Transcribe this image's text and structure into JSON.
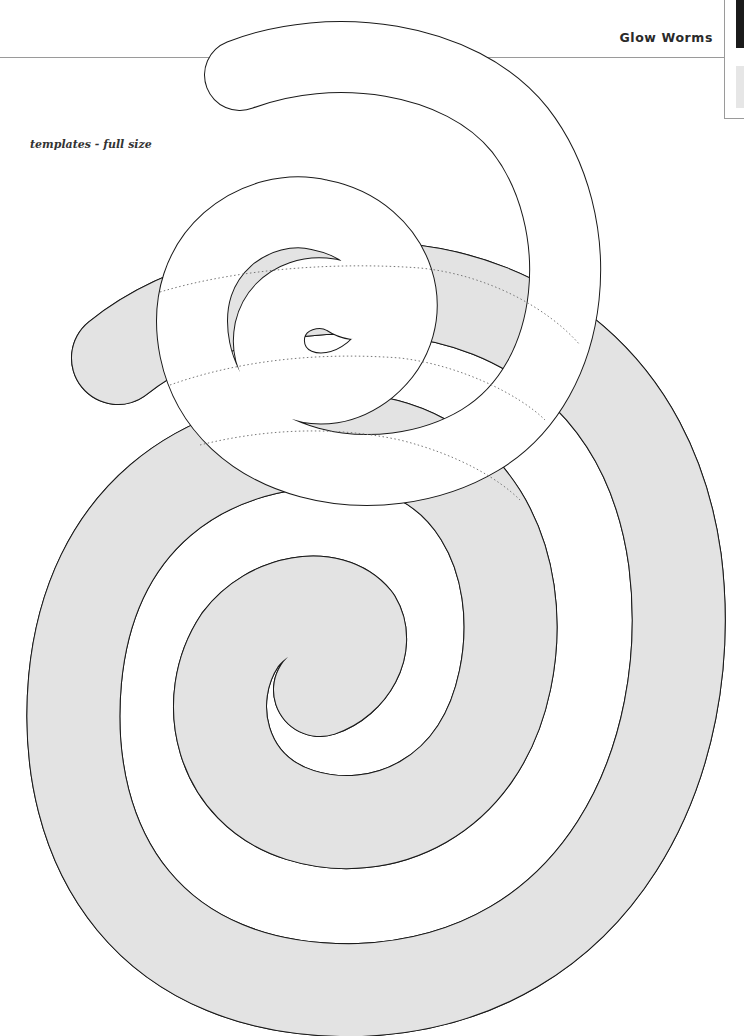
{
  "header": {
    "title": "Glow Worms"
  },
  "page": {
    "subtitle": "templates - full size"
  },
  "figure": {
    "shapes": [
      {
        "name": "gray-spiral",
        "fill": "#e3e3e3",
        "outline": "#1a1a1a"
      },
      {
        "name": "white-spiral",
        "fill": "#ffffff",
        "outline": "#1a1a1a"
      }
    ],
    "guide_line_style": "dotted",
    "guide_line_color": "#777777"
  },
  "colors": {
    "background": "#ffffff",
    "gray_fill": "#e3e3e3",
    "outline": "#1a1a1a",
    "rule": "#9a9a9a",
    "tab_dark": "#1a1a1a",
    "tab_light": "#e6e6e6"
  }
}
